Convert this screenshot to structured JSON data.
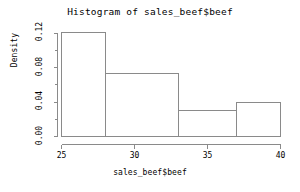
{
  "chart_data": {
    "type": "bar",
    "title": "Histogram of sales_beef$beef",
    "xlabel": "sales_beef$beef",
    "ylabel": "Density",
    "bin_edges": [
      25,
      28,
      33,
      37,
      40
    ],
    "categories": [
      "25-28",
      "28-33",
      "33-37",
      "37-40"
    ],
    "values": [
      0.121,
      0.073,
      0.03,
      0.04
    ],
    "xlim": [
      25,
      40
    ],
    "ylim": [
      0,
      0.125
    ],
    "xticks": [
      25,
      30,
      35,
      40
    ],
    "xtick_labels": [
      "25",
      "30",
      "35",
      "40"
    ],
    "yticks": [
      0.0,
      0.04,
      0.08,
      0.12
    ],
    "ytick_labels": [
      "0.00",
      "0.04",
      "0.08",
      "0.12"
    ],
    "yminor_ticks": [
      0.02,
      0.06,
      0.1
    ],
    "grid": false,
    "legend": false,
    "bar_fill": "none",
    "bar_border_color": "#8a8a8a",
    "axis_color": "#8a8a8a",
    "background": "#ffffff"
  }
}
